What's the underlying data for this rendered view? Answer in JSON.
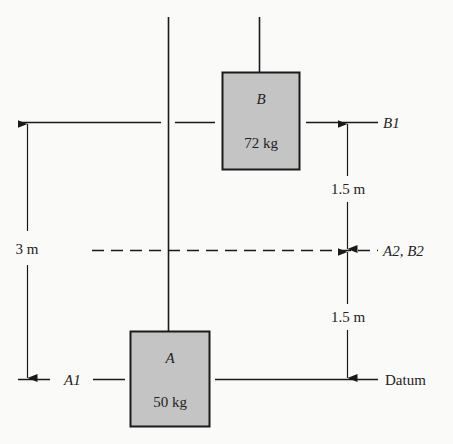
{
  "diagram": {
    "type": "pulley-energy-levels",
    "colors": {
      "line": "#1a1a1a",
      "box_fill": "#c4c4c4",
      "box_stroke": "#1a1a1a",
      "background": "#fafaf8"
    },
    "blocks": {
      "a": {
        "name": "A",
        "mass": "50 kg"
      },
      "b": {
        "name": "B",
        "mass": "72 kg"
      }
    },
    "levels": {
      "b1": {
        "label": "B1"
      },
      "a2b2": {
        "label": "A2, B2"
      },
      "datum": {
        "label": "Datum"
      },
      "a1": {
        "label": "A1"
      }
    },
    "dimensions": {
      "total": "3 m",
      "upper": "1.5 m",
      "lower": "1.5 m"
    }
  }
}
